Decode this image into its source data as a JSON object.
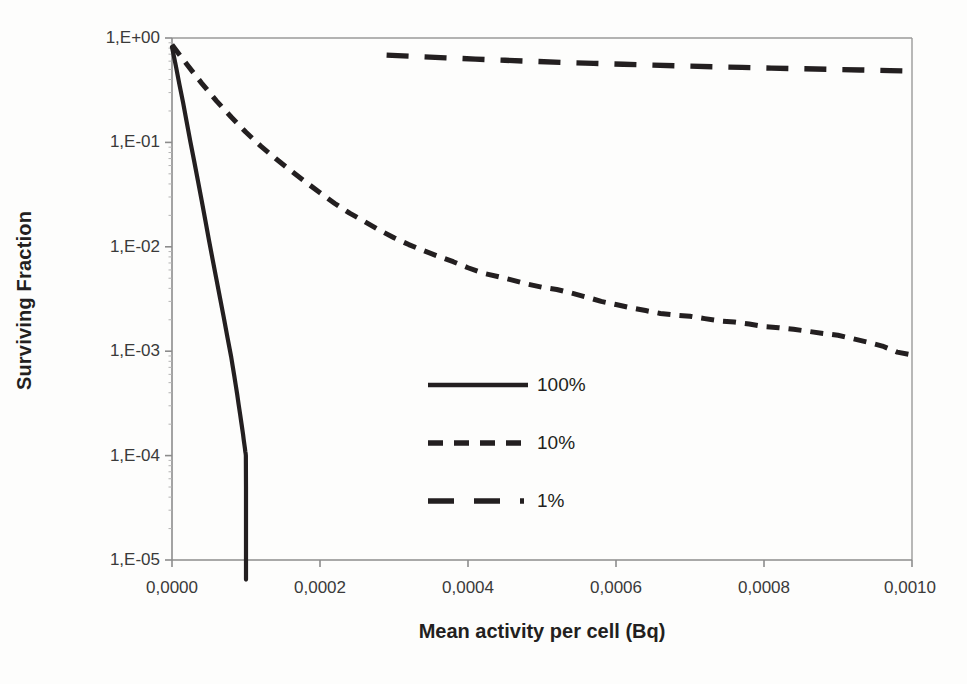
{
  "figure": {
    "background_color": "#fdfdfc",
    "ink_color": "#231f20",
    "axis_color": "#8c8c8c"
  },
  "chart_data": {
    "type": "line",
    "title": "",
    "xlabel": "Mean activity per cell (Bq)",
    "ylabel": "Surviving Fraction",
    "xlim": [
      0.0,
      0.001
    ],
    "ylim": [
      1e-05,
      1.0
    ],
    "yscale": "log",
    "xscale": "linear",
    "grid": false,
    "legend_position": "center",
    "xticklabels": [
      "0,0000",
      "0,0002",
      "0,0004",
      "0,0006",
      "0,0008",
      "0,0010"
    ],
    "xticks": [
      0.0,
      0.0002,
      0.0004,
      0.0006,
      0.0008,
      0.001
    ],
    "yticklabels": [
      "1,E+00",
      "1,E-01",
      "1,E-02",
      "1,E-03",
      "1,E-04",
      "1,E-05"
    ],
    "yticks": [
      1.0,
      0.1,
      0.01,
      0.001,
      0.0001,
      1e-05
    ],
    "series": [
      {
        "name": "100%",
        "linestyle": "solid",
        "color": "#231f20",
        "x": [
          0.0,
          5e-06,
          1e-05,
          1.5e-05,
          2e-05,
          2.5e-05,
          3e-05,
          3.5e-05,
          4e-05,
          4.5e-05,
          5e-05,
          5.5e-05,
          6e-05,
          6.5e-05,
          7e-05,
          7.5e-05,
          8e-05,
          8.2e-05,
          8.4e-05,
          8.6e-05,
          8.8e-05,
          9e-05,
          9.2e-05,
          9.4e-05,
          9.6e-05,
          9.7e-05,
          9.8e-05,
          9.85e-05,
          9.9e-05,
          9.95e-05,
          9.98e-05,
          0.0001,
          0.0001,
          0.0001
        ],
        "y": [
          0.82,
          0.55,
          0.36,
          0.24,
          0.155,
          0.1,
          0.066,
          0.043,
          0.028,
          0.018,
          0.0115,
          0.0075,
          0.0049,
          0.0032,
          0.0021,
          0.00135,
          0.00088,
          0.00072,
          0.00059,
          0.00048,
          0.00039,
          0.00031,
          0.00025,
          0.0002,
          0.00016,
          0.00014,
          0.000125,
          0.000118,
          0.00011,
          0.000105,
          0.0001,
          5e-05,
          1e-05,
          6.5e-06
        ]
      },
      {
        "name": "10%",
        "linestyle": "dashed-short",
        "color": "#231f20",
        "x": [
          0.0,
          2e-05,
          4e-05,
          6e-05,
          8e-05,
          0.0001,
          0.00012,
          0.00014,
          0.00016,
          0.00018,
          0.0002,
          0.00022,
          0.00024,
          0.00026,
          0.00028,
          0.0003,
          0.00032,
          0.00034,
          0.00036,
          0.00038,
          0.0004,
          0.00042,
          0.00044,
          0.00046,
          0.00048,
          0.0005,
          0.00052,
          0.00054,
          0.00056,
          0.00058,
          0.0006,
          0.00062,
          0.00064,
          0.00066,
          0.00068,
          0.0007,
          0.00072,
          0.00074,
          0.00076,
          0.00078,
          0.0008,
          0.00082,
          0.00084,
          0.00086,
          0.00088,
          0.0009,
          0.00092,
          0.00094,
          0.00096,
          0.00098,
          0.001
        ],
        "y": [
          0.86,
          0.56,
          0.37,
          0.25,
          0.175,
          0.125,
          0.092,
          0.07,
          0.054,
          0.042,
          0.033,
          0.026,
          0.021,
          0.0175,
          0.0145,
          0.0122,
          0.0105,
          0.0092,
          0.0081,
          0.0072,
          0.0063,
          0.0056,
          0.0052,
          0.0048,
          0.0044,
          0.0041,
          0.0039,
          0.0036,
          0.0033,
          0.003,
          0.0028,
          0.0026,
          0.00245,
          0.0023,
          0.00222,
          0.00216,
          0.00205,
          0.00195,
          0.0019,
          0.00182,
          0.00172,
          0.00168,
          0.00162,
          0.00155,
          0.00148,
          0.00142,
          0.00132,
          0.00122,
          0.00112,
          0.00098,
          0.00092
        ]
      },
      {
        "name": "1%",
        "linestyle": "dashed-long",
        "color": "#231f20",
        "x": [
          0.00029,
          0.00033,
          0.00037,
          0.00041,
          0.00045,
          0.00049,
          0.00053,
          0.00057,
          0.00061,
          0.00065,
          0.00069,
          0.00073,
          0.00077,
          0.00081,
          0.00085,
          0.00089,
          0.00093,
          0.00097,
          0.001
        ],
        "y": [
          0.685,
          0.665,
          0.645,
          0.628,
          0.612,
          0.597,
          0.583,
          0.571,
          0.56,
          0.55,
          0.54,
          0.531,
          0.523,
          0.515,
          0.508,
          0.501,
          0.494,
          0.487,
          0.482
        ]
      }
    ]
  },
  "legend": {
    "entries": [
      {
        "label": "100%",
        "linestyle": "solid"
      },
      {
        "label": "10%",
        "linestyle": "dashed-short"
      },
      {
        "label": "1%",
        "linestyle": "dashed-long"
      }
    ]
  }
}
